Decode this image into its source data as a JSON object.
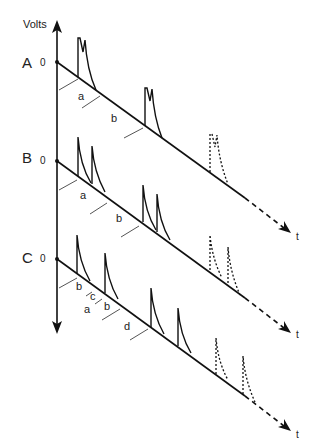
{
  "diagram": {
    "y_axis_label": "Volts",
    "time_label": "t",
    "zero_label": "0",
    "rows": [
      {
        "id": "A",
        "label": "A",
        "segment_labels": [
          "a",
          "b"
        ],
        "pattern": "paired spikes (doublets) separated by interval a within burst, b between bursts"
      },
      {
        "id": "B",
        "label": "B",
        "segment_labels": [
          "a",
          "b"
        ],
        "pattern": "two separated spikes per burst, interval a within, b between"
      },
      {
        "id": "C",
        "label": "C",
        "segment_labels": [
          "b",
          "c",
          "a",
          "b",
          "d"
        ],
        "pattern": "single spikes with intervals b, c, a, b, d"
      }
    ],
    "colors": {
      "line": "#111111",
      "tick": "#555555"
    }
  }
}
